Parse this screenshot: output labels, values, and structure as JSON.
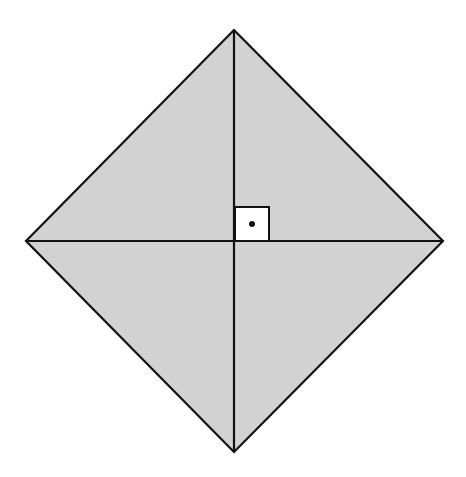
{
  "diagram": {
    "colors": {
      "fill": "#d2d2d2",
      "stroke": "#111111",
      "marker_fill": "#ffffff",
      "dot": "#111111",
      "background": "#ffffff"
    },
    "vertices": {
      "top": [
        234,
        30
      ],
      "right": [
        443,
        241
      ],
      "bottom": [
        234,
        452
      ],
      "left": [
        26,
        241
      ]
    },
    "center": [
      234,
      241
    ],
    "right_angle_marker": {
      "x": 235,
      "y": 207,
      "size": 34,
      "dot": [
        252,
        224
      ]
    }
  }
}
